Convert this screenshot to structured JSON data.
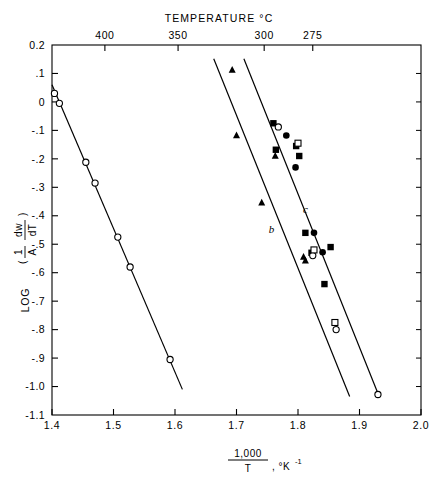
{
  "chart_data": {
    "type": "scatter",
    "title": "TEMPERATURE °C",
    "xlabel": "1,000/T , °K⁻¹",
    "ylabel": "LOG ( (1/A)(dw/dT) )",
    "xlim": [
      1.4,
      2.0
    ],
    "ylim": [
      -1.1,
      0.2
    ],
    "grid": false,
    "legend": "none",
    "x_ticks": [
      "1.4",
      "1.5",
      "1.6",
      "1.7",
      "1.8",
      "1.9",
      "2.0"
    ],
    "x_tick_values": [
      1.4,
      1.5,
      1.6,
      1.7,
      1.8,
      1.9,
      2.0
    ],
    "y_ticks": [
      "0.2",
      ".1",
      "0",
      "-.1",
      "-.2",
      "-.3",
      "-.4",
      "-.5",
      "-.6",
      "-.7",
      "-.8",
      "-.9",
      "-1.0",
      "-1.1"
    ],
    "y_tick_values": [
      0.2,
      0.1,
      0.0,
      -0.1,
      -0.2,
      -0.3,
      -0.4,
      -0.5,
      -0.6,
      -0.7,
      -0.8,
      -0.9,
      -1.0,
      -1.1
    ],
    "secondary_axis": {
      "label": "TEMPERATURE °C",
      "position": "top",
      "ticks": [
        "400",
        "350",
        "300",
        "275"
      ],
      "tick_values": [
        400,
        350,
        300,
        275
      ],
      "tick_x_positions": [
        1.486,
        1.605,
        1.745,
        1.824
      ]
    },
    "xlabel_numerator": "1,000",
    "xlabel_denominator": "T",
    "xlabel_suffix": ", °K",
    "xlabel_exponent": "-1",
    "ylabel_parts": {
      "log": "LOG",
      "num1": "1",
      "den1": "A",
      "num2": "dw",
      "den2": "dT"
    },
    "series": [
      {
        "name": "a",
        "marker": "open-circle",
        "label": "",
        "line": {
          "x": [
            1.4,
            1.612
          ],
          "y": [
            0.06,
            -1.01
          ]
        },
        "points": [
          {
            "x": 1.404,
            "y": 0.03
          },
          {
            "x": 1.412,
            "y": -0.005
          },
          {
            "x": 1.455,
            "y": -0.212
          },
          {
            "x": 1.47,
            "y": -0.285
          },
          {
            "x": 1.507,
            "y": -0.475
          },
          {
            "x": 1.527,
            "y": -0.58
          },
          {
            "x": 1.592,
            "y": -0.905
          }
        ]
      },
      {
        "name": "b",
        "marker": "filled-triangle",
        "label": "b",
        "label_x": 1.757,
        "label_y": -0.46,
        "line": {
          "x": [
            1.663,
            1.884
          ],
          "y": [
            0.152,
            -1.035
          ]
        },
        "points": [
          {
            "x": 1.693,
            "y": 0.112
          },
          {
            "x": 1.7,
            "y": -0.118
          },
          {
            "x": 1.741,
            "y": -0.355
          },
          {
            "x": 1.763,
            "y": -0.19
          },
          {
            "x": 1.809,
            "y": -0.545
          },
          {
            "x": 1.812,
            "y": -0.558
          }
        ]
      },
      {
        "name": "c",
        "marker": "filled-square",
        "label": "c",
        "label_x": 1.812,
        "label_y": -0.392,
        "line": {
          "x": [
            1.712,
            1.932
          ],
          "y": [
            0.152,
            -1.035
          ]
        },
        "points": [
          {
            "x": 1.76,
            "y": -0.075
          },
          {
            "x": 1.764,
            "y": -0.168
          },
          {
            "x": 1.797,
            "y": -0.155
          },
          {
            "x": 1.802,
            "y": -0.19
          },
          {
            "x": 1.812,
            "y": -0.46
          },
          {
            "x": 1.822,
            "y": -0.53
          },
          {
            "x": 1.843,
            "y": -0.64
          },
          {
            "x": 1.853,
            "y": -0.51
          }
        ]
      },
      {
        "name": "c-open",
        "marker": "open-circle",
        "label": "",
        "points": [
          {
            "x": 1.768,
            "y": -0.088
          },
          {
            "x": 1.824,
            "y": -0.54
          },
          {
            "x": 1.862,
            "y": -0.8
          },
          {
            "x": 1.93,
            "y": -1.028
          }
        ]
      },
      {
        "name": "c-opensq",
        "marker": "open-square",
        "label": "",
        "points": [
          {
            "x": 1.8,
            "y": -0.145
          },
          {
            "x": 1.826,
            "y": -0.52
          },
          {
            "x": 1.86,
            "y": -0.775
          }
        ]
      },
      {
        "name": "b-circ",
        "marker": "filled-circle",
        "label": "",
        "points": [
          {
            "x": 1.781,
            "y": -0.118
          },
          {
            "x": 1.796,
            "y": -0.23
          },
          {
            "x": 1.826,
            "y": -0.46
          },
          {
            "x": 1.84,
            "y": -0.528
          }
        ]
      }
    ]
  }
}
